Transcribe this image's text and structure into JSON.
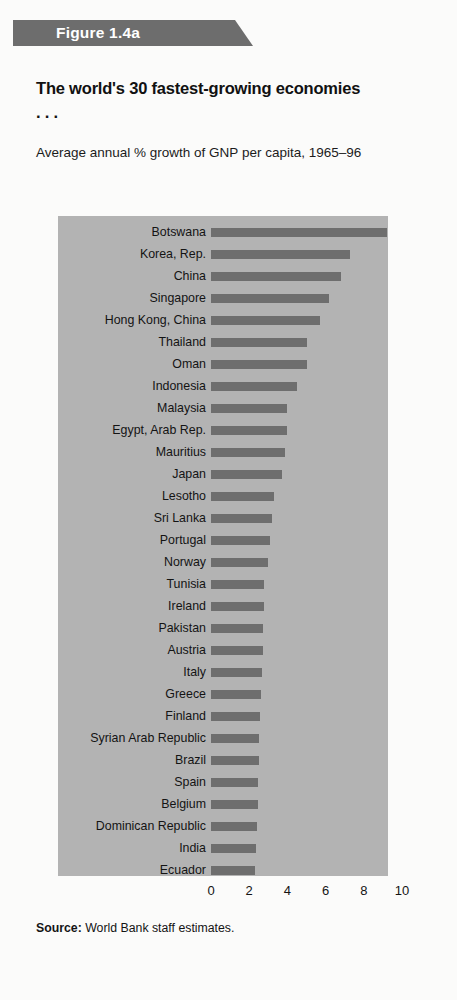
{
  "figure": {
    "banner_label": "Figure 1.4a",
    "title": "The world's 30 fastest-growing economies . . .",
    "subtitle": "Average annual % growth of GNP per capita, 1965–96",
    "source_label": "Source:",
    "source_text": "World Bank staff estimates."
  },
  "colors": {
    "page_background": "#fbfbfa",
    "banner": "#6d6d6d",
    "banner_text": "#ffffff",
    "plot_background": "#b3b3b3",
    "bar": "#6e6e6e",
    "text": "#141414"
  },
  "chart_data": {
    "type": "bar",
    "orientation": "horizontal",
    "title": "The world's 30 fastest-growing economies . . .",
    "subtitle": "Average annual % growth of GNP per capita, 1965–96",
    "xlabel": "",
    "ylabel": "",
    "xlim": [
      0,
      10
    ],
    "xticks": [
      0,
      2,
      4,
      6,
      8,
      10
    ],
    "xtick_labels": [
      "0",
      "2",
      "4",
      "6",
      "8",
      "10"
    ],
    "grid": false,
    "legend": false,
    "categories": [
      "Botswana",
      "Korea, Rep.",
      "China",
      "Singapore",
      "Hong Kong, China",
      "Thailand",
      "Oman",
      "Indonesia",
      "Malaysia",
      "Egypt, Arab Rep.",
      "Mauritius",
      "Japan",
      "Lesotho",
      "Sri Lanka",
      "Portugal",
      "Norway",
      "Tunisia",
      "Ireland",
      "Pakistan",
      "Austria",
      "Italy",
      "Greece",
      "Finland",
      "Syrian Arab Republic",
      "Brazil",
      "Spain",
      "Belgium",
      "Dominican Republic",
      "India",
      "Ecuador"
    ],
    "values": [
      9.2,
      7.3,
      6.8,
      6.2,
      5.7,
      5.0,
      5.0,
      4.5,
      4.0,
      4.0,
      3.9,
      3.7,
      3.3,
      3.2,
      3.1,
      3.0,
      2.8,
      2.75,
      2.7,
      2.7,
      2.65,
      2.6,
      2.55,
      2.5,
      2.5,
      2.45,
      2.45,
      2.4,
      2.35,
      2.3
    ]
  }
}
